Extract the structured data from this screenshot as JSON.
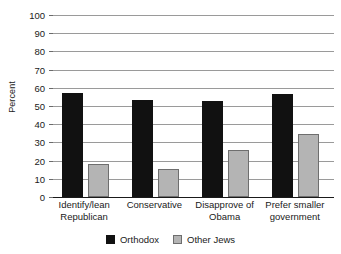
{
  "chart_data": {
    "type": "bar",
    "title": "",
    "xlabel": "",
    "ylabel": "Percent",
    "ylim": [
      0,
      100
    ],
    "ytick_step": 10,
    "grid": true,
    "legend_position": "bottom-center",
    "categories": [
      "Identify/lean Republican",
      "Conservative",
      "Disapprove of Obama",
      "Prefer smaller government"
    ],
    "category_lines": [
      [
        "Identify/lean",
        "Republican"
      ],
      [
        "Conservative"
      ],
      [
        "Disapprove of",
        "Obama"
      ],
      [
        "Prefer smaller",
        "government"
      ]
    ],
    "ytick_labels": [
      "100",
      "90",
      "80",
      "70",
      "60",
      "50",
      "40",
      "30",
      "20",
      "10",
      "0"
    ],
    "series": [
      {
        "name": "Orthodox",
        "color": "#111111",
        "values": [
          57,
          53.5,
          53,
          56.5
        ]
      },
      {
        "name": "Other Jews",
        "color": "#b4b4b4",
        "values": [
          18,
          15.5,
          26,
          34.5
        ]
      }
    ]
  },
  "colors": {
    "orthodox": "#111111",
    "other_jews": "#b4b4b4",
    "gridline": "#9a9a9a",
    "axis": "#1a1a1a",
    "background": "#ffffff"
  }
}
